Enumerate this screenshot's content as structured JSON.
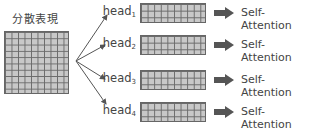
{
  "diagram": {
    "source_label": "分散表現",
    "heads": [
      {
        "label": "head",
        "sub": "1",
        "target": "Self-Attention"
      },
      {
        "label": "head",
        "sub": "2",
        "target": "Self-Attention"
      },
      {
        "label": "head",
        "sub": "3",
        "target": "Self-Attention"
      },
      {
        "label": "head",
        "sub": "4",
        "target": "Self-Attention"
      }
    ],
    "source_grid": {
      "rows": 10,
      "cols": 10
    },
    "head_grid": {
      "rows": 3,
      "cols": 10
    },
    "colors": {
      "grid_fill": "#c8c8c8",
      "grid_line": "#6a6a6a",
      "arrow": "#555555",
      "block_arrow": "#555555"
    }
  }
}
